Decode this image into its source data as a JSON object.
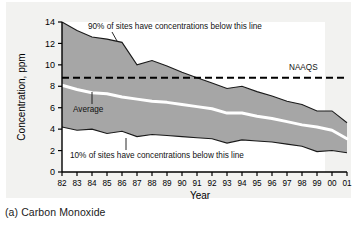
{
  "figure": {
    "caption": "(a) Carbon Monoxide",
    "panel_label": "(a)",
    "panel_title": "Carbon Monoxide"
  },
  "annotations": {
    "upper_band": "90% of sites have concentrations below this line",
    "lower_band": "10% of sites have concentrations below this line",
    "average": "Average",
    "standard": "NAAQS"
  },
  "colors": {
    "band_fill": "#a6a6a6",
    "band_edge": "#1a1a1a",
    "average_line": "#ffffff",
    "standard_line": "#000000",
    "plot_background": "#ffffff",
    "page_background": "#f2f2f0"
  },
  "chart_data": {
    "type": "area",
    "title": "",
    "subtitle": "",
    "xlabel": "Year",
    "ylabel": "Concentration, ppm",
    "xlim": [
      1982,
      2001
    ],
    "ylim": [
      0,
      14
    ],
    "yticks": [
      0,
      2,
      4,
      6,
      8,
      10,
      12,
      14
    ],
    "ytick_labels": [
      "0",
      "2",
      "4",
      "6",
      "8",
      "10",
      "12",
      "14"
    ],
    "grid": false,
    "legend": "inline-annotations",
    "x": [
      1982,
      1983,
      1984,
      1985,
      1986,
      1987,
      1988,
      1989,
      1990,
      1991,
      1992,
      1993,
      1994,
      1995,
      1996,
      1997,
      1998,
      1999,
      2000,
      2001
    ],
    "xtick_labels": [
      "82",
      "83",
      "84",
      "85",
      "86",
      "87",
      "88",
      "89",
      "90",
      "91",
      "92",
      "93",
      "94",
      "95",
      "96",
      "97",
      "98",
      "99",
      "00",
      "01"
    ],
    "series": [
      {
        "name": "90th percentile",
        "label": "90% of sites have concentrations below this line",
        "values": [
          14.0,
          13.2,
          12.6,
          12.4,
          12.1,
          10.0,
          10.4,
          9.9,
          9.3,
          8.8,
          8.3,
          7.8,
          8.0,
          7.5,
          7.1,
          6.6,
          6.3,
          5.7,
          5.7,
          4.6
        ]
      },
      {
        "name": "Average",
        "label": "Average",
        "values": [
          8.1,
          7.7,
          7.4,
          7.3,
          7.0,
          6.8,
          6.6,
          6.5,
          6.3,
          6.1,
          5.9,
          5.5,
          5.5,
          5.2,
          5.0,
          4.7,
          4.4,
          4.2,
          3.9,
          3.1
        ]
      },
      {
        "name": "10th percentile",
        "label": "10% of sites have concentrations below this line",
        "values": [
          4.2,
          3.9,
          4.0,
          3.6,
          3.8,
          3.3,
          3.5,
          3.4,
          3.3,
          3.2,
          3.1,
          2.7,
          3.0,
          2.9,
          2.8,
          2.6,
          2.4,
          1.9,
          2.0,
          1.8
        ]
      }
    ],
    "reference_line": {
      "name": "NAAQS",
      "label": "NAAQS",
      "value": 8.8,
      "style": "dashed"
    }
  }
}
